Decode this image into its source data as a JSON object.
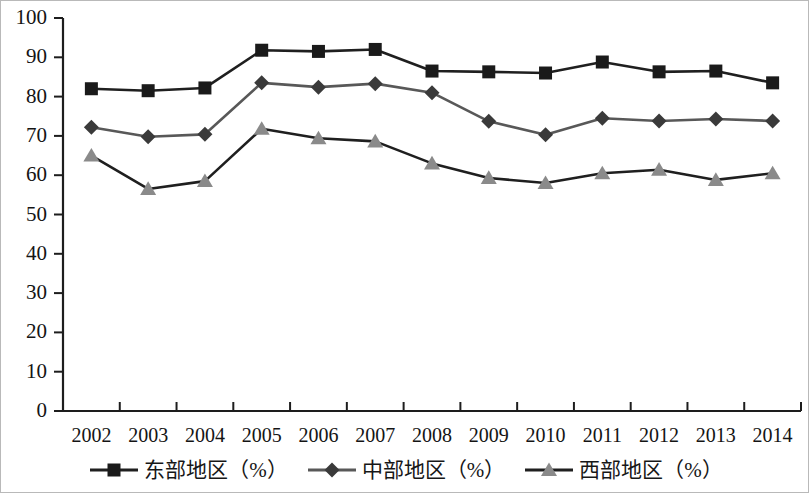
{
  "chart_data": {
    "type": "line",
    "title": "",
    "subtitle": "",
    "xlabel": "",
    "ylabel": "",
    "categories": [
      "2002",
      "2003",
      "2004",
      "2005",
      "2006",
      "2007",
      "2008",
      "2009",
      "2010",
      "2011",
      "2012",
      "2013",
      "2014"
    ],
    "ylim": [
      0,
      100
    ],
    "y_ticks": [
      0,
      10,
      20,
      30,
      40,
      50,
      60,
      70,
      80,
      90,
      100
    ],
    "y_tick_labels": [
      "0",
      "10",
      "20",
      "30",
      "40",
      "50",
      "60",
      "70",
      "80",
      "90",
      "100"
    ],
    "grid": false,
    "legend_position": "bottom",
    "series": [
      {
        "name": "东部地区（%）",
        "marker": "square",
        "color": "#1a1a1a",
        "line_color": "#1f1f1f",
        "values": [
          82.0,
          81.5,
          82.2,
          91.8,
          91.5,
          92.0,
          86.5,
          86.3,
          86.0,
          88.8,
          86.3,
          86.5,
          83.5
        ]
      },
      {
        "name": "中部地区（%）",
        "marker": "diamond",
        "color": "#3a3a3a",
        "line_color": "#585858",
        "values": [
          72.2,
          69.8,
          70.4,
          83.5,
          82.4,
          83.3,
          81.0,
          73.7,
          70.3,
          74.5,
          73.8,
          74.3,
          73.8
        ]
      },
      {
        "name": "西部地区（%）",
        "marker": "triangle",
        "color": "#8a8a8a",
        "line_color": "#1f1f1f",
        "values": [
          65.0,
          56.5,
          58.5,
          71.8,
          69.4,
          68.6,
          63.0,
          59.3,
          58.0,
          60.5,
          61.4,
          58.8,
          60.5
        ]
      }
    ]
  },
  "legend": {
    "entries": [
      {
        "label": "东部地区（%）",
        "marker": "square-marker-icon"
      },
      {
        "label": "中部地区（%）",
        "marker": "diamond-marker-icon"
      },
      {
        "label": "西部地区（%）",
        "marker": "triangle-marker-icon"
      }
    ]
  },
  "axes": {
    "y_axis_name": "value-axis",
    "x_axis_name": "year-axis"
  }
}
